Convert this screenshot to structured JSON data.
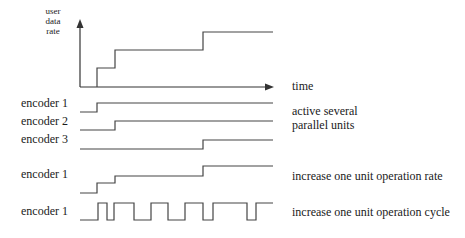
{
  "axes": {
    "y_label_lines": [
      "user",
      "data",
      "rate"
    ],
    "x_label": "time"
  },
  "rows": [
    {
      "label": "encoder 1",
      "group": "parallel"
    },
    {
      "label": "encoder 2",
      "group": "parallel"
    },
    {
      "label": "encoder 3",
      "group": "parallel"
    },
    {
      "label": "encoder 1",
      "group": "rate"
    },
    {
      "label": "encoder 1",
      "group": "cycle"
    }
  ],
  "annotations": {
    "parallel_line1": "active several",
    "parallel_line2": "parallel units",
    "rate": "increase one unit operation rate",
    "cycle": "increase one unit operation cycle"
  },
  "colors": {
    "line": "#444444",
    "text": "#1a1a1a",
    "background": "#ffffff"
  }
}
